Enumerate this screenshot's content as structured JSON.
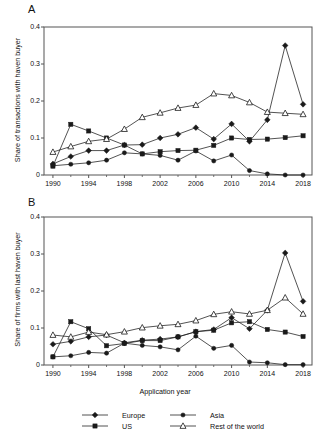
{
  "figure": {
    "width": 324,
    "height": 438,
    "background": "#ffffff",
    "line_color": "#1a1a1a",
    "frame_color": "#555555"
  },
  "panels": [
    {
      "label": "A",
      "ylabel": "Share of transactions with haven buyer",
      "xlabel": "",
      "yticks": [
        "0",
        "0.1",
        "0.2",
        "0.3",
        "0.4"
      ],
      "ytick_values": [
        0,
        0.1,
        0.2,
        0.3,
        0.4
      ],
      "xticks": [
        "1990",
        "1994",
        "1998",
        "2002",
        "2006",
        "2010",
        "2014",
        "2018"
      ],
      "xtick_values": [
        1990,
        1994,
        1998,
        2002,
        2006,
        2010,
        2014,
        2018
      ]
    },
    {
      "label": "B",
      "ylabel": "Share of firms with last haven buyer",
      "xlabel": "Application year",
      "yticks": [
        "0",
        "0.1",
        "0.2",
        "0.3",
        "0.4"
      ],
      "ytick_values": [
        0,
        0.1,
        0.2,
        0.3,
        0.4
      ],
      "xticks": [
        "1990",
        "1994",
        "1998",
        "2002",
        "2006",
        "2010",
        "2014",
        "2018"
      ],
      "xtick_values": [
        1990,
        1994,
        1998,
        2002,
        2006,
        2010,
        2014,
        2018
      ]
    }
  ],
  "legend": {
    "entries": [
      {
        "label": "Europe",
        "marker": "diamond",
        "filled": true
      },
      {
        "label": "Asia",
        "marker": "circle",
        "filled": true
      },
      {
        "label": "US",
        "marker": "square",
        "filled": true
      },
      {
        "label": "Rest of the world",
        "marker": "triangle",
        "filled": false
      }
    ]
  },
  "chart_data": [
    {
      "type": "line",
      "title": "A",
      "xlabel": "",
      "ylabel": "Share of transactions with haven buyer",
      "xlim": [
        1989,
        2019
      ],
      "ylim": [
        0,
        0.4
      ],
      "grid": false,
      "legend_position": "bottom",
      "x": [
        1990,
        1992,
        1994,
        1996,
        1998,
        2000,
        2002,
        2004,
        2006,
        2008,
        2010,
        2012,
        2014,
        2016,
        2018
      ],
      "series": [
        {
          "name": "Europe",
          "marker": "diamond",
          "values": [
            0.03,
            0.05,
            0.066,
            0.066,
            0.081,
            0.082,
            0.1,
            0.11,
            0.128,
            0.097,
            0.138,
            0.091,
            0.149,
            0.35,
            0.191
          ]
        },
        {
          "name": "Asia",
          "marker": "circle",
          "values": [
            0.025,
            0.029,
            0.033,
            0.04,
            0.06,
            0.057,
            0.053,
            0.04,
            0.065,
            0.038,
            0.054,
            0.012,
            0.003,
            0.0,
            0.0
          ]
        },
        {
          "name": "US",
          "marker": "square",
          "values": [
            0.024,
            0.137,
            0.119,
            0.1,
            0.081,
            0.057,
            0.063,
            0.066,
            0.067,
            0.08,
            0.1,
            0.096,
            0.097,
            0.101,
            0.106
          ]
        },
        {
          "name": "Rest of the world",
          "marker": "triangle",
          "values": [
            0.062,
            0.077,
            0.091,
            0.097,
            0.124,
            0.156,
            0.168,
            0.181,
            0.189,
            0.22,
            0.215,
            0.196,
            0.17,
            0.167,
            0.164
          ]
        }
      ]
    },
    {
      "type": "line",
      "title": "B",
      "xlabel": "Application year",
      "ylabel": "Share of firms with last haven buyer",
      "xlim": [
        1989,
        2019
      ],
      "ylim": [
        0,
        0.4
      ],
      "grid": false,
      "legend_position": "bottom",
      "x": [
        1990,
        1992,
        1994,
        1996,
        1998,
        2000,
        2002,
        2004,
        2006,
        2008,
        2010,
        2012,
        2014,
        2016,
        2018
      ],
      "series": [
        {
          "name": "Europe",
          "marker": "diamond",
          "values": [
            0.056,
            0.064,
            0.076,
            0.081,
            0.06,
            0.067,
            0.07,
            0.076,
            0.09,
            0.096,
            0.128,
            0.098,
            0.148,
            0.303,
            0.172
          ]
        },
        {
          "name": "Asia",
          "marker": "circle",
          "values": [
            0.022,
            0.025,
            0.034,
            0.032,
            0.059,
            0.053,
            0.049,
            0.041,
            0.078,
            0.045,
            0.053,
            0.008,
            0.006,
            0.001,
            0.001
          ]
        },
        {
          "name": "US",
          "marker": "square",
          "values": [
            0.022,
            0.117,
            0.098,
            0.052,
            0.058,
            0.066,
            0.066,
            0.076,
            0.09,
            0.094,
            0.114,
            0.117,
            0.096,
            0.089,
            0.077
          ]
        },
        {
          "name": "Rest of the world",
          "marker": "triangle",
          "values": [
            0.081,
            0.076,
            0.089,
            0.082,
            0.09,
            0.101,
            0.106,
            0.11,
            0.12,
            0.137,
            0.144,
            0.138,
            0.148,
            0.182,
            0.138
          ]
        }
      ]
    }
  ]
}
